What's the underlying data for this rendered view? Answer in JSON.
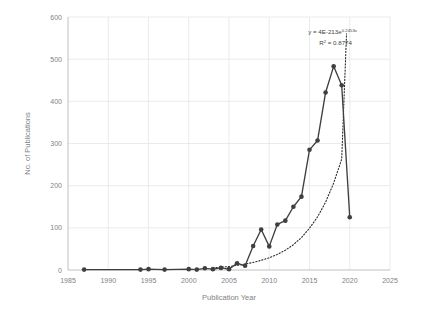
{
  "chart_data": {
    "type": "line",
    "title": "",
    "xlabel": "Publication Year",
    "ylabel": "No. of Publications",
    "xlim": [
      1985,
      2025
    ],
    "ylim": [
      0,
      600
    ],
    "xticks": [
      1985,
      1990,
      1995,
      2000,
      2005,
      2010,
      2015,
      2020,
      2025
    ],
    "yticks": [
      0,
      100,
      200,
      300,
      400,
      500,
      600
    ],
    "grid": true,
    "legend": null,
    "series": [
      {
        "name": "No. of Publications",
        "marker": "circle",
        "color": "#3f3f3f",
        "x": [
          1987,
          1994,
          1995,
          1997,
          2000,
          2001,
          2002,
          2003,
          2004,
          2005,
          2006,
          2007,
          2008,
          2009,
          2010,
          2011,
          2012,
          2013,
          2014,
          2015,
          2016,
          2017,
          2018,
          2019,
          2020
        ],
        "values": [
          1,
          1,
          2,
          1,
          2,
          1,
          4,
          2,
          5,
          2,
          16,
          10,
          57,
          96,
          56,
          108,
          117,
          150,
          174,
          285,
          307,
          421,
          483,
          438,
          125
        ]
      },
      {
        "name": "Exponential trendline",
        "style": "dotted",
        "color": "#2b2b2b",
        "x": [
          2003,
          2004,
          2005,
          2006,
          2007,
          2008,
          2009,
          2010,
          2011,
          2012,
          2013,
          2014,
          2015,
          2016,
          2017,
          2018,
          2019,
          2019.6
        ],
        "values": [
          5,
          7,
          8,
          11,
          14,
          18,
          23,
          29,
          37,
          47,
          60,
          77,
          99,
          126,
          161,
          206,
          263,
          560
        ]
      }
    ],
    "annotations": {
      "equation_prefix": "y = 4E-213e",
      "equation_exponent": "0.2453x",
      "r_squared_label": "R",
      "r_squared_sup": "2",
      "r_squared_value": " = 0.8774"
    }
  }
}
